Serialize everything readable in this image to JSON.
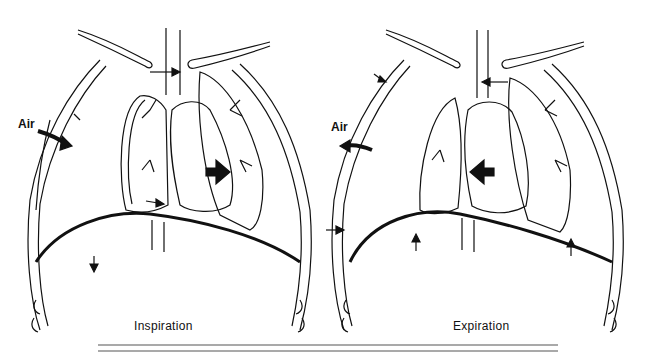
{
  "figure": {
    "panels": [
      {
        "id": "inspiration",
        "caption": "Inspiration",
        "air_label": "Air",
        "air_direction": "inward",
        "heart_shift_arrow": "right",
        "diaphragm_arrow": "down"
      },
      {
        "id": "expiration",
        "caption": "Expiration",
        "air_label": "Air",
        "air_direction": "outward",
        "heart_shift_arrow": "left",
        "diaphragm_arrow": "up"
      }
    ],
    "colors": {
      "line": "#111111",
      "background": "#ffffff",
      "rule": "#555555"
    }
  }
}
